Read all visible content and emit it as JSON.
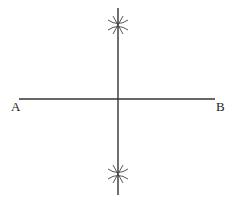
{
  "diagram": {
    "type": "perpendicular-bisector-construction",
    "labels": {
      "a": "A",
      "b": "B"
    },
    "segment_ab": {
      "x1": 19,
      "y1": 99,
      "x2": 215,
      "y2": 99
    },
    "bisector": {
      "x1": 118,
      "y1": 8,
      "x2": 118,
      "y2": 195
    },
    "arc_marks": [
      {
        "x": 118,
        "y": 25
      },
      {
        "x": 118,
        "y": 174
      }
    ],
    "colors": {
      "line": "#333333",
      "background": "#ffffff"
    }
  }
}
